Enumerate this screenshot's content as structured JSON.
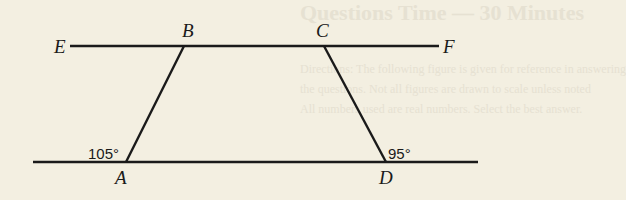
{
  "background_text": {
    "title": "Questions Time — 30 Minutes",
    "lines": [
      "Directions: The following figure is given for reference in answering",
      "the questions. Not all figures are drawn to scale unless noted",
      "All numbers used are real numbers. Select the best answer."
    ]
  },
  "diagram": {
    "points": {
      "E": "E",
      "F": "F",
      "B": "B",
      "C": "C",
      "A": "A",
      "D": "D"
    },
    "angles": {
      "A": "105°",
      "D": "95°"
    },
    "colors": {
      "line": "#1a1a1a",
      "paper": "#f3efe1"
    }
  }
}
